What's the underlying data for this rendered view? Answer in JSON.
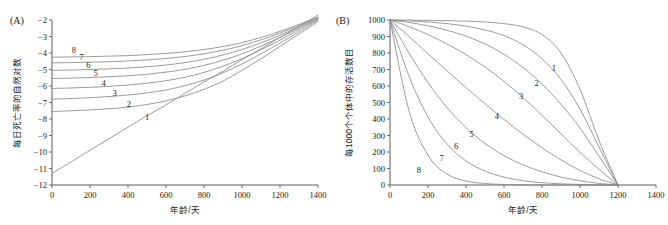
{
  "figure": {
    "panel_a_tag": "(A)",
    "panel_b_tag": "(B)"
  },
  "chart_data": [
    {
      "type": "line",
      "panel": "(A)",
      "title": "",
      "xlabel": "年龄/天",
      "ylabel": "每日死亡率的自然对数",
      "xlim": [
        0,
        1400
      ],
      "ylim": [
        -12,
        -2
      ],
      "xticks": [
        0,
        200,
        400,
        600,
        800,
        1000,
        1200,
        1400
      ],
      "yticks": [
        -2,
        -3,
        -4,
        -5,
        -6,
        -7,
        -8,
        -9,
        -10,
        -11,
        -12
      ],
      "grid": false,
      "legend": "inline-curve-numbers",
      "curve_color": "#8a8a8a",
      "x": [
        0,
        100,
        200,
        300,
        400,
        500,
        600,
        700,
        800,
        900,
        1000,
        1100,
        1200,
        1300,
        1400
      ],
      "series": [
        {
          "name": "1",
          "label_x": 500,
          "label_y": -8.05,
          "values": [
            -11.3,
            -10.6,
            -9.9,
            -9.2,
            -8.5,
            -7.8,
            -7.15,
            -6.45,
            -5.75,
            -5.1,
            -4.4,
            -3.75,
            -3.05,
            -2.4,
            -1.7
          ]
        },
        {
          "name": "2",
          "label_x": 405,
          "label_y": -7.3,
          "values": [
            -7.55,
            -7.5,
            -7.45,
            -7.38,
            -7.28,
            -7.12,
            -6.9,
            -6.6,
            -6.2,
            -5.7,
            -5.05,
            -4.35,
            -3.6,
            -2.85,
            -2.1
          ]
        },
        {
          "name": "3",
          "label_x": 330,
          "label_y": -6.62,
          "values": [
            -6.8,
            -6.76,
            -6.71,
            -6.64,
            -6.55,
            -6.42,
            -6.24,
            -5.98,
            -5.64,
            -5.2,
            -4.66,
            -4.05,
            -3.4,
            -2.72,
            -2.02
          ]
        },
        {
          "name": "4",
          "label_x": 272,
          "label_y": -6.0,
          "values": [
            -6.15,
            -6.12,
            -6.08,
            -6.02,
            -5.94,
            -5.83,
            -5.68,
            -5.47,
            -5.18,
            -4.8,
            -4.34,
            -3.8,
            -3.22,
            -2.6,
            -1.96
          ]
        },
        {
          "name": "5",
          "label_x": 230,
          "label_y": -5.4,
          "values": [
            -5.55,
            -5.52,
            -5.49,
            -5.44,
            -5.38,
            -5.29,
            -5.16,
            -4.99,
            -4.75,
            -4.44,
            -4.05,
            -3.58,
            -3.06,
            -2.5,
            -1.92
          ]
        },
        {
          "name": "6",
          "label_x": 192,
          "label_y": -4.88,
          "values": [
            -5.05,
            -5.03,
            -5.0,
            -4.96,
            -4.91,
            -4.83,
            -4.73,
            -4.58,
            -4.38,
            -4.12,
            -3.79,
            -3.38,
            -2.92,
            -2.41,
            -1.88
          ]
        },
        {
          "name": "7",
          "label_x": 155,
          "label_y": -4.45,
          "values": [
            -4.6,
            -4.58,
            -4.56,
            -4.53,
            -4.48,
            -4.42,
            -4.33,
            -4.21,
            -4.05,
            -3.83,
            -3.55,
            -3.2,
            -2.79,
            -2.33,
            -1.85
          ]
        },
        {
          "name": "8",
          "label_x": 115,
          "label_y": -4.02,
          "values": [
            -4.25,
            -4.24,
            -4.22,
            -4.19,
            -4.16,
            -4.1,
            -4.03,
            -3.93,
            -3.79,
            -3.61,
            -3.37,
            -3.06,
            -2.69,
            -2.27,
            -1.82
          ]
        }
      ]
    },
    {
      "type": "line",
      "panel": "(B)",
      "title": "",
      "xlabel": "年龄/天",
      "ylabel": "每1000个个体中的存活数目",
      "xlim": [
        0,
        1400
      ],
      "ylim": [
        0,
        1000
      ],
      "xticks": [
        0,
        200,
        400,
        600,
        800,
        1000,
        1200,
        1400
      ],
      "yticks": [
        0,
        100,
        200,
        300,
        400,
        500,
        600,
        700,
        800,
        900,
        1000
      ],
      "grid": false,
      "legend": "inline-curve-numbers",
      "curve_color": "#8a8a8a",
      "x": [
        0,
        100,
        200,
        300,
        400,
        500,
        600,
        700,
        800,
        900,
        1000,
        1100,
        1200
      ],
      "series": [
        {
          "name": "1",
          "label_x": 862,
          "label_y": 690,
          "values": [
            1000,
            999,
            998,
            996,
            993,
            988,
            978,
            958,
            912,
            800,
            580,
            270,
            0
          ]
        },
        {
          "name": "2",
          "label_x": 772,
          "label_y": 600,
          "values": [
            1000,
            995,
            988,
            978,
            963,
            940,
            905,
            850,
            765,
            640,
            460,
            230,
            0
          ]
        },
        {
          "name": "3",
          "label_x": 690,
          "label_y": 520,
          "values": [
            1000,
            985,
            965,
            938,
            902,
            855,
            792,
            712,
            612,
            490,
            345,
            175,
            0
          ]
        },
        {
          "name": "4",
          "label_x": 562,
          "label_y": 398,
          "values": [
            1000,
            960,
            912,
            855,
            790,
            715,
            628,
            530,
            422,
            310,
            198,
            95,
            0
          ]
        },
        {
          "name": "5",
          "label_x": 430,
          "label_y": 288,
          "values": [
            1000,
            900,
            795,
            692,
            590,
            492,
            398,
            308,
            226,
            152,
            88,
            38,
            0
          ]
        },
        {
          "name": "6",
          "label_x": 348,
          "label_y": 218,
          "values": [
            1000,
            800,
            620,
            470,
            348,
            252,
            178,
            122,
            80,
            48,
            26,
            10,
            0
          ]
        },
        {
          "name": "7",
          "label_x": 272,
          "label_y": 148,
          "values": [
            1000,
            660,
            412,
            248,
            146,
            84,
            48,
            26,
            14,
            7,
            3,
            1,
            0
          ]
        },
        {
          "name": "8",
          "label_x": 152,
          "label_y": 72,
          "values": [
            1000,
            450,
            180,
            66,
            24,
            9,
            3,
            1,
            0,
            0,
            0,
            0,
            0
          ]
        }
      ]
    }
  ]
}
